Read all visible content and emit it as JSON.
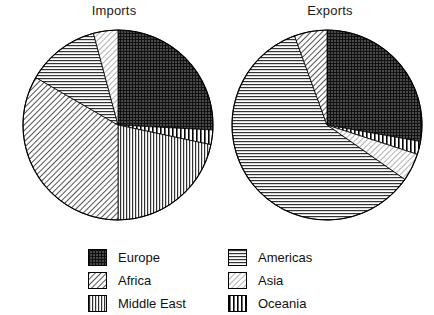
{
  "charts": {
    "imports": {
      "title": "Imports"
    },
    "exports": {
      "title": "Exports"
    }
  },
  "legend": {
    "left_column": [
      {
        "label": "Europe",
        "pattern": "crosshatch-dark"
      },
      {
        "label": "Africa",
        "pattern": "diagonal-forward"
      },
      {
        "label": "Middle East",
        "pattern": "vertical-medium"
      }
    ],
    "right_column": [
      {
        "label": "Americas",
        "pattern": "horizontal-medium"
      },
      {
        "label": "Asia",
        "pattern": "diagonal-backward-light"
      },
      {
        "label": "Oceania",
        "pattern": "vertical-wide"
      }
    ]
  },
  "chart_data": [
    {
      "type": "pie",
      "title": "Imports",
      "labels": [
        "Europe",
        "Oceania",
        "Middle East",
        "Africa",
        "Americas",
        "Asia"
      ],
      "values": [
        25.8,
        2.5,
        21.7,
        33.3,
        12.5,
        4.2
      ],
      "unit": "percent",
      "start_angle_deg": 0,
      "direction": "clockwise",
      "legend_position": "bottom",
      "grid": false,
      "slices": [
        {
          "label": "Europe",
          "percent": 25.8,
          "start_deg": 0.0,
          "end_deg": 93.0,
          "pattern": "crosshatch-dark"
        },
        {
          "label": "Oceania",
          "percent": 2.5,
          "start_deg": 93.0,
          "end_deg": 102.0,
          "pattern": "vertical-wide"
        },
        {
          "label": "Middle East",
          "percent": 21.7,
          "start_deg": 102.0,
          "end_deg": 180.0,
          "pattern": "vertical-medium"
        },
        {
          "label": "Africa",
          "percent": 33.3,
          "start_deg": 180.0,
          "end_deg": 300.0,
          "pattern": "diagonal-forward"
        },
        {
          "label": "Americas",
          "percent": 12.5,
          "start_deg": 300.0,
          "end_deg": 345.0,
          "pattern": "horizontal-medium"
        },
        {
          "label": "Asia",
          "percent": 4.2,
          "start_deg": 345.0,
          "end_deg": 360.0,
          "pattern": "diagonal-backward-light"
        }
      ]
    },
    {
      "type": "pie",
      "title": "Exports",
      "labels": [
        "Europe",
        "Oceania",
        "Asia",
        "Americas",
        "Africa"
      ],
      "values": [
        27.8,
        2.2,
        4.7,
        59.7,
        5.6
      ],
      "unit": "percent",
      "start_angle_deg": 0,
      "direction": "clockwise",
      "legend_position": "bottom",
      "grid": false,
      "slices": [
        {
          "label": "Europe",
          "percent": 27.8,
          "start_deg": 0.0,
          "end_deg": 100.0,
          "pattern": "crosshatch-dark"
        },
        {
          "label": "Oceania",
          "percent": 2.2,
          "start_deg": 100.0,
          "end_deg": 108.0,
          "pattern": "vertical-wide"
        },
        {
          "label": "Asia",
          "percent": 4.7,
          "start_deg": 108.0,
          "end_deg": 125.0,
          "pattern": "diagonal-backward-light"
        },
        {
          "label": "Americas",
          "percent": 59.7,
          "start_deg": 125.0,
          "end_deg": 340.0,
          "pattern": "horizontal-medium"
        },
        {
          "label": "Africa",
          "percent": 5.6,
          "start_deg": 340.0,
          "end_deg": 360.0,
          "pattern": "diagonal-forward"
        }
      ]
    }
  ]
}
